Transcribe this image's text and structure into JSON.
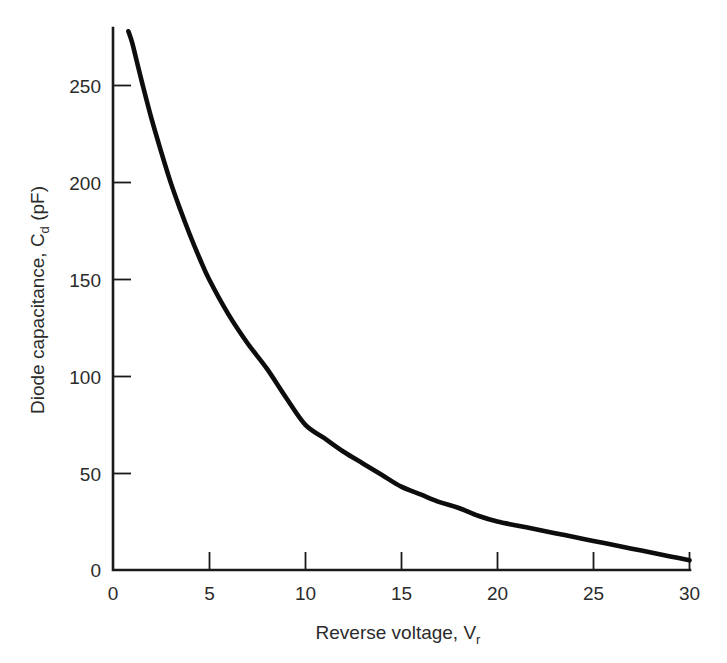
{
  "chart_data": {
    "type": "line",
    "title": "",
    "xlabel": "Reverse voltage, V_r",
    "xlabel_main": "Reverse voltage, V",
    "xlabel_sub": "r",
    "ylabel": "Diode capacitance, C_d (pF)",
    "ylabel_part1": "Diode capacitance, C",
    "ylabel_sub": "d",
    "ylabel_part2": " (pF)",
    "xlim": [
      0,
      30
    ],
    "ylim": [
      0,
      275
    ],
    "xticks": [
      0,
      5,
      10,
      15,
      20,
      25,
      30
    ],
    "xtick_labels": [
      "0",
      "5",
      "10",
      "15",
      "20",
      "25",
      "30"
    ],
    "yticks": [
      0,
      50,
      100,
      150,
      200,
      250
    ],
    "ytick_labels": [
      "0",
      "50",
      "100",
      "150",
      "200",
      "250"
    ],
    "grid": false,
    "legend": null,
    "series": [
      {
        "name": "Diode capacitance vs reverse voltage",
        "color": "#0d0d0d",
        "x": [
          0.8,
          1.0,
          1.25,
          1.5,
          2.0,
          2.5,
          3.0,
          3.5,
          4.0,
          4.5,
          5.0,
          6.0,
          7.0,
          8.0,
          9.0,
          10.0,
          11.0,
          12.0,
          13.0,
          14.0,
          15.0,
          16.0,
          17.0,
          18.0,
          19.0,
          20.0,
          21.0,
          22.0,
          23.0,
          24.0,
          25.0,
          26.0,
          27.0,
          28.0,
          29.0,
          30.0
        ],
        "y": [
          278,
          272,
          262,
          252,
          233,
          216,
          200,
          186,
          173,
          161,
          150,
          132,
          117,
          104,
          89,
          75,
          68,
          61,
          55,
          49,
          43,
          39,
          35,
          32,
          28,
          25,
          23,
          21,
          19,
          17,
          15,
          13,
          11,
          9,
          7,
          5
        ]
      }
    ],
    "key_readings": [
      {
        "voltage": 5,
        "capacitance": 150
      },
      {
        "voltage": 10,
        "capacitance": 75
      },
      {
        "voltage": 15,
        "capacitance": 43
      },
      {
        "voltage": 20,
        "capacitance": 25
      },
      {
        "voltage": 25,
        "capacitance": 15
      },
      {
        "voltage": 30,
        "capacitance": 5
      }
    ],
    "colors": {
      "curve": "#0d0d0d",
      "axis": "#1a1a1a",
      "text": "#2b2b2b",
      "background": "#ffffff"
    }
  }
}
